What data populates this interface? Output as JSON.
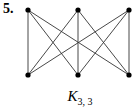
{
  "problem_number": "5.",
  "graph": {
    "name": "K",
    "subscript": "3, 3",
    "top_nodes": [
      {
        "id": "a1",
        "x": 28,
        "y": 10
      },
      {
        "id": "a2",
        "x": 78,
        "y": 10
      },
      {
        "id": "a3",
        "x": 129,
        "y": 10
      }
    ],
    "bottom_nodes": [
      {
        "id": "b1",
        "x": 28,
        "y": 75
      },
      {
        "id": "b2",
        "x": 78,
        "y": 75
      },
      {
        "id": "b3",
        "x": 129,
        "y": 75
      }
    ],
    "edges": [
      [
        "a1",
        "b1"
      ],
      [
        "a1",
        "b2"
      ],
      [
        "a1",
        "b3"
      ],
      [
        "a2",
        "b1"
      ],
      [
        "a2",
        "b2"
      ],
      [
        "a2",
        "b3"
      ],
      [
        "a3",
        "b1"
      ],
      [
        "a3",
        "b2"
      ],
      [
        "a3",
        "b3"
      ]
    ],
    "edge_color": "#333333",
    "node_color": "#000000"
  }
}
